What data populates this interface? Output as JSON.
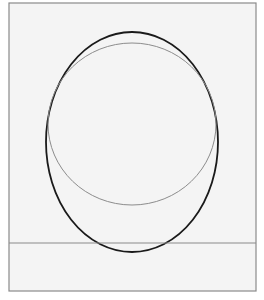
{
  "figure": {
    "background": "#f4f4f4",
    "frame": {
      "x": 9,
      "y": 3,
      "width": 247,
      "height": 288,
      "stroke": "#8a8a8a",
      "stroke_width": 1.2
    },
    "shapes": [
      {
        "id": "outer-ellipse",
        "kind": "ellipse",
        "cx": 132,
        "cy": 142,
        "rx": 86,
        "ry": 110,
        "stroke": "#1a1a1a",
        "stroke_width": 1.8
      },
      {
        "id": "inner-circle",
        "kind": "ellipse",
        "cx": 132,
        "cy": 124,
        "rx": 84,
        "ry": 81,
        "stroke": "#8c8c8c",
        "stroke_width": 1.0
      },
      {
        "id": "ground-line",
        "kind": "line",
        "x1": 9,
        "y1": 243,
        "x2": 256,
        "y2": 243,
        "stroke": "#8a8a8a",
        "stroke_width": 1.0
      }
    ]
  }
}
